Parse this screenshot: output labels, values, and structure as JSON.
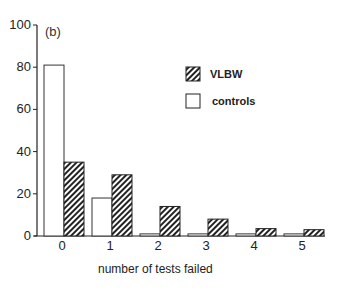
{
  "chart_data": {
    "type": "bar",
    "title": "",
    "panel_label": "(b)",
    "xlabel": "number of tests failed",
    "ylabel": "",
    "categories": [
      "0",
      "1",
      "2",
      "3",
      "4",
      "5"
    ],
    "series": [
      {
        "name": "controls",
        "values": [
          81,
          18,
          1,
          1,
          1,
          1
        ],
        "fill": "white"
      },
      {
        "name": "VLBW",
        "values": [
          35,
          29,
          14,
          8,
          3.5,
          3
        ],
        "fill": "hatched"
      }
    ],
    "ylim": [
      0,
      100
    ],
    "yticks": [
      0,
      20,
      40,
      60,
      80,
      100
    ],
    "grid": false,
    "legend_position": "upper right"
  },
  "legend": {
    "vlbw_label": "VLBW",
    "controls_label": "controls"
  }
}
